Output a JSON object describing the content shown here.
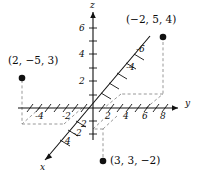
{
  "figure": {
    "type": "3d-coordinate-diagram",
    "width": 201,
    "height": 182,
    "background": "#ffffff",
    "ink_color": "#111111",
    "dash_color": "#8d8d8d"
  },
  "axes": {
    "y": {
      "label": "y",
      "label_pos": [
        185,
        103
      ],
      "positive_ticks": [
        "2",
        "4",
        "6",
        "8"
      ],
      "negative_ticks": [
        "-4",
        "-2"
      ],
      "visible_tick_labels": [
        {
          "text": "2",
          "x": 106,
          "y": 116
        },
        {
          "text": "4",
          "x": 124,
          "y": 116
        },
        {
          "text": "6",
          "x": 143,
          "y": 116
        },
        {
          "text": "8",
          "x": 161,
          "y": 116
        },
        {
          "text": "-2",
          "x": 66,
          "y": 116
        },
        {
          "text": "-4",
          "x": 39,
          "y": 116
        }
      ]
    },
    "z": {
      "label": "z",
      "label_pos": [
        90,
        2
      ],
      "visible_tick_labels": [
        {
          "text": "6",
          "x": 80,
          "y": 28
        },
        {
          "text": "4",
          "x": 80,
          "y": 54
        },
        {
          "text": "2",
          "x": 80,
          "y": 81
        },
        {
          "text": "-2",
          "x": 76,
          "y": 134
        }
      ]
    },
    "x": {
      "label": "x",
      "label_pos": [
        43,
        166
      ],
      "visible_tick_labels": [
        {
          "text": "2",
          "x": 82,
          "y": 124
        },
        {
          "text": "4",
          "x": 66,
          "y": 141
        },
        {
          "text": "-4",
          "x": 127,
          "y": 67
        },
        {
          "text": "-6",
          "x": 137,
          "y": 49
        }
      ]
    }
  },
  "points": [
    {
      "name": "point-a",
      "label": "(2, −5, 3)",
      "label_x": 8,
      "label_y": 59,
      "dot_x": 22,
      "dot_y": 78
    },
    {
      "name": "point-b",
      "label": "(−2, 5, 4)",
      "label_x": 127,
      "label_y": 18,
      "dot_x": 163,
      "dot_y": 37
    },
    {
      "name": "point-c",
      "label": "(3, 3, −2)",
      "label_x": 110,
      "label_y": 157,
      "dot_x": 103,
      "dot_y": 161
    }
  ],
  "origin": {
    "x": 93,
    "y": 108
  }
}
